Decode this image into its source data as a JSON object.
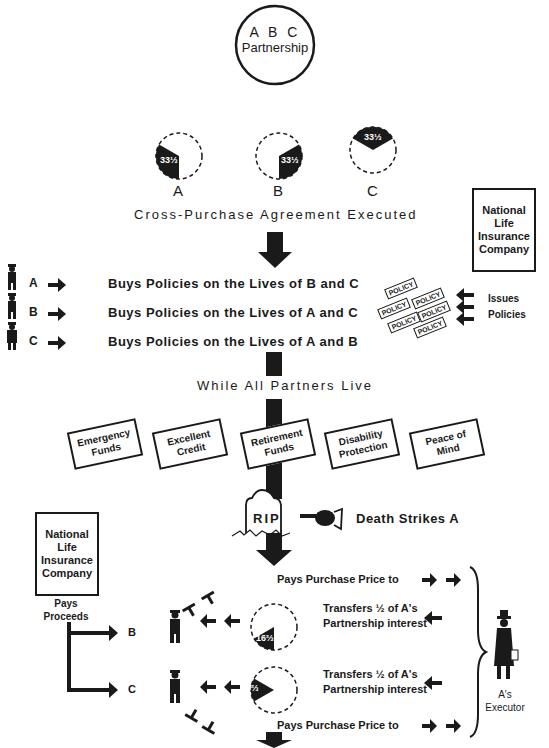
{
  "partnership": {
    "line1": "A B C",
    "line2": "Partnership"
  },
  "shares_initial": [
    {
      "partner": "A",
      "value": "33⅓"
    },
    {
      "partner": "B",
      "value": "33⅓"
    },
    {
      "partner": "C",
      "value": "33⅓"
    }
  ],
  "agreement_label": "Cross-Purchase Agreement Executed",
  "insurer_top": {
    "lines": [
      "National",
      "Life",
      "Insurance",
      "Company"
    ]
  },
  "purchases": [
    {
      "partner": "A",
      "text": "Buys Policies on the Lives of B and C"
    },
    {
      "partner": "B",
      "text": "Buys Policies on the Lives of A and C"
    },
    {
      "partner": "C",
      "text": "Buys Policies on the Lives of A and B"
    }
  ],
  "policy_label": "POLICY",
  "issues_label": {
    "line1": "Issues",
    "line2": "Policies"
  },
  "while_live_label": "While All Partners Live",
  "benefits": [
    {
      "line1": "Emergency",
      "line2": "Funds"
    },
    {
      "line1": "Excellent",
      "line2": "Credit"
    },
    {
      "line1": "Retirement",
      "line2": "Funds"
    },
    {
      "line1": "Disability",
      "line2": "Protection"
    },
    {
      "line1": "Peace of",
      "line2": "Mind"
    }
  ],
  "tombstone_label": "RIP",
  "death_label": "Death Strikes A",
  "insurer_bottom": {
    "lines": [
      "National",
      "Life",
      "Insurance",
      "Company"
    ]
  },
  "pays_proceeds": {
    "line1": "Pays",
    "line2": "Proceeds"
  },
  "recipients": [
    "B",
    "C"
  ],
  "pays_price_top": "Pays Purchase Price to",
  "pays_price_bottom": "Pays Purchase Price to",
  "transfer_b": {
    "line1": "Transfers ½ of A's",
    "line2": "Partnership interest"
  },
  "transfer_c": {
    "line1": "Transfers ½ of A's",
    "line2": "Partnership interest"
  },
  "shares_transfer": [
    {
      "to": "B",
      "value": "16⅔"
    },
    {
      "to": "C",
      "value": "16⅔"
    }
  ],
  "executor_label": {
    "line1": "A's",
    "line2": "Executor"
  }
}
